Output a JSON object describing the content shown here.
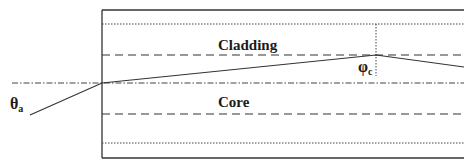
{
  "diagram": {
    "type": "optical-fiber-ray-propagation",
    "labels": {
      "cladding": "Cladding",
      "core": "Core",
      "acceptance_angle_symbol": "θ",
      "acceptance_angle_subscript": "a",
      "critical_angle_symbol": "φ",
      "critical_angle_subscript": "c"
    },
    "colors": {
      "line": "#333333",
      "text": "#1a1a1a",
      "background": "#ffffff"
    },
    "geometry": {
      "fiber_left_x": 102,
      "fiber_right_x": 464,
      "outer_top_y": 10,
      "outer_bottom_y": 158,
      "cladding_top_dotted_y": 24,
      "core_cladding_upper_dashed_y": 55,
      "axis_y": 83,
      "core_cladding_lower_dashed_y": 114,
      "cladding_bottom_dotted_y": 143,
      "axis_start_x": 12,
      "ray_points": [
        [
          30,
          115
        ],
        [
          102,
          83
        ],
        [
          376,
          55
        ],
        [
          464,
          67
        ]
      ],
      "normal_x": 376,
      "normal_top_y": 24,
      "normal_bottom_y": 76
    }
  }
}
